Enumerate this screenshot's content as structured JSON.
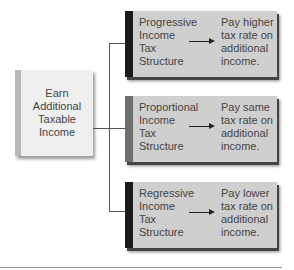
{
  "source": {
    "label": "Earn\nAdditional\nTaxable\nIncome"
  },
  "branches": [
    {
      "label": "Progressive\nIncome\nTax\nStructure",
      "result": "Pay higher\ntax rate on\nadditional\nincome.",
      "bar_color": "#1a1a1a"
    },
    {
      "label": "Proportional\nIncome\nTax\nStructure",
      "result": "Pay same\ntax rate on\nadditional\nincome.",
      "bar_color": "#6e6e6e"
    },
    {
      "label": "Regressive\nIncome\nTax\nStructure",
      "result": "Pay lower\ntax rate on\nadditional\nincome.",
      "bar_color": "#1a1a1a"
    }
  ]
}
